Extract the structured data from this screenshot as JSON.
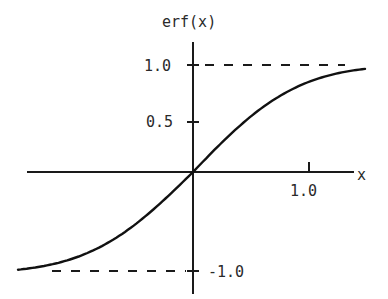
{
  "chart_data": {
    "type": "line",
    "title": "",
    "xlabel": "x",
    "ylabel": "erf(x)",
    "x_ticks": [
      {
        "value": 1.0,
        "label": "1.0"
      }
    ],
    "y_ticks": [
      {
        "value": 1.0,
        "label": "1.0"
      },
      {
        "value": 0.5,
        "label": "0.5"
      },
      {
        "value": -1.0,
        "label": "-1.0"
      }
    ],
    "asymptotes": [
      {
        "y": 1.0,
        "style": "dashed"
      },
      {
        "y": -1.0,
        "style": "dashed"
      }
    ],
    "xlim": [
      -1.5,
      1.5
    ],
    "ylim": [
      -1.2,
      1.25
    ],
    "grid": false,
    "legend": null,
    "series": [
      {
        "name": "erf(x)",
        "x": [
          -1.5,
          -1.25,
          -1.0,
          -0.75,
          -0.5,
          -0.25,
          0.0,
          0.25,
          0.5,
          0.75,
          1.0,
          1.25,
          1.5
        ],
        "values": [
          -0.966,
          -0.923,
          -0.843,
          -0.711,
          -0.52,
          -0.276,
          0.0,
          0.276,
          0.52,
          0.711,
          0.843,
          0.923,
          0.966
        ]
      }
    ]
  },
  "labels": {
    "ylabel": "erf(x)",
    "xlabel": "x",
    "y_tick_1": "1.0",
    "y_tick_05": "0.5",
    "y_tick_m1": "-1.0",
    "x_tick_1": "1.0"
  }
}
